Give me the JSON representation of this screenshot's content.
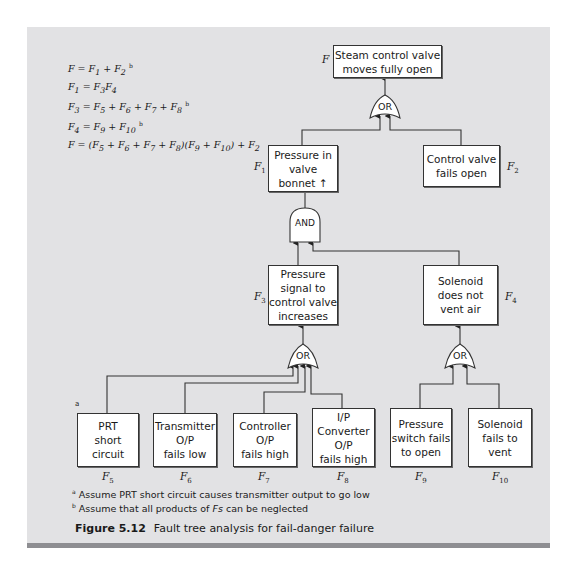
{
  "equations": [
    "F = F1 + F2 ᵇ",
    "F1 = F3F4",
    "F3 = F5 + F6 + F7 + F8 ᵇ",
    "F4 = F9 + F10 ᵇ",
    "F = (F5 + F6 + F7 + F8)(F9 + F10) + F2"
  ],
  "events": {
    "top": {
      "id": "F",
      "text": "Steam control valve\nmoves fully open"
    },
    "f1": {
      "id": "F1",
      "text": "Pressure in\nvalve\nbonnet ↑"
    },
    "f2": {
      "id": "F2",
      "text": "Control valve\nfails open"
    },
    "f3": {
      "id": "F3",
      "text": "Pressure\nsignal to\ncontrol valve\nincreases"
    },
    "f4": {
      "id": "F4",
      "text": "Solenoid\ndoes not\nvent air"
    },
    "f5": {
      "id": "F5",
      "text": "PRT\nshort\ncircuit"
    },
    "f6": {
      "id": "F6",
      "text": "Transmitter\nO/P\nfails low"
    },
    "f7": {
      "id": "F7",
      "text": "Controller\nO/P\nfails high"
    },
    "f8": {
      "id": "F8",
      "text": "I/P\nConverter\nO/P\nfails high"
    },
    "f9": {
      "id": "F9",
      "text": "Pressure\nswitch fails\nto open"
    },
    "f10": {
      "id": "F10",
      "text": "Solenoid\nfails to\nvent"
    }
  },
  "labels": {
    "F": "F",
    "F1": "1",
    "F2": "2",
    "F3": "3",
    "F4": "4",
    "F5": "5",
    "F6": "6",
    "F7": "7",
    "F8": "8",
    "F9": "9",
    "F10": "10",
    "prefix": "F"
  },
  "gates": {
    "or_top": "OR",
    "and_f1": "AND",
    "or_f3": "OR",
    "or_f4": "OR"
  },
  "footnote_marker_a": "a",
  "notes": {
    "a_mark": "a",
    "a_text": " Assume PRT short circuit causes transmitter output to go low",
    "b_mark": "b",
    "b_text_1": " Assume that all products of ",
    "b_text_fs": "Fs",
    "b_text_2": " can be neglected"
  },
  "caption": {
    "number": "Figure 5.12",
    "title": "Fault tree analysis for fail-danger failure"
  },
  "colors": {
    "panel": "#e2e2e4",
    "band": "#8e8e92",
    "line": "#333333"
  }
}
